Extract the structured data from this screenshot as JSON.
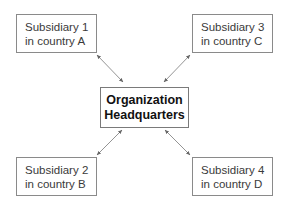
{
  "diagram": {
    "center": {
      "line1": "Organization",
      "line2": "Headquarters"
    },
    "nodes": [
      {
        "id": "subsidiary-1",
        "line1": "Subsidiary 1",
        "line2": "in country A"
      },
      {
        "id": "subsidiary-2",
        "line1": "Subsidiary 2",
        "line2": "in country B"
      },
      {
        "id": "subsidiary-3",
        "line1": "Subsidiary 3",
        "line2": "in country C"
      },
      {
        "id": "subsidiary-4",
        "line1": "Subsidiary 4",
        "line2": "in country D"
      }
    ],
    "edges": [
      {
        "from": "subsidiary-1",
        "to": "headquarters",
        "type": "bidirectional"
      },
      {
        "from": "subsidiary-2",
        "to": "headquarters",
        "type": "bidirectional"
      },
      {
        "from": "subsidiary-3",
        "to": "headquarters",
        "type": "bidirectional"
      },
      {
        "from": "subsidiary-4",
        "to": "headquarters",
        "type": "bidirectional"
      }
    ],
    "colors": {
      "border": "#8a8a8a",
      "text": "#3a3a3a",
      "arrow": "#777777"
    }
  }
}
